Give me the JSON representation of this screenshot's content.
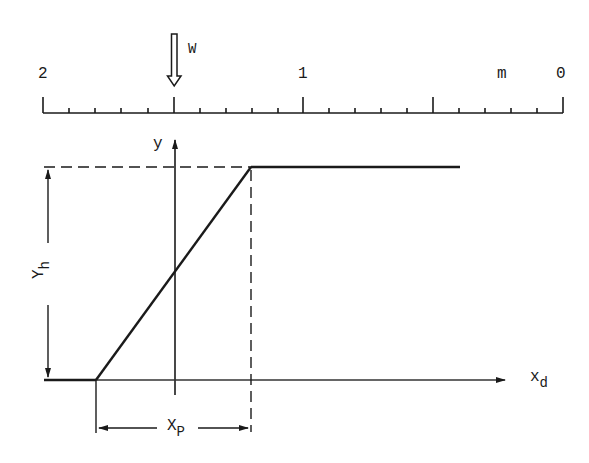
{
  "scale": {
    "labels": [
      {
        "text": "2",
        "x": 38,
        "y": 66
      },
      {
        "text": "1",
        "x": 298,
        "y": 66
      },
      {
        "text": "m",
        "x": 497,
        "y": 66
      },
      {
        "text": "0",
        "x": 556,
        "y": 66
      }
    ],
    "unit": "m",
    "range": [
      2,
      0
    ]
  },
  "marker": {
    "label": "W"
  },
  "axes": {
    "y_label": "y",
    "x_label_main": "x",
    "x_label_sub": "d"
  },
  "dimensions": {
    "yh_main": "Y",
    "yh_sub": "h",
    "xp_main": "X",
    "xp_sub": "P"
  },
  "colors": {
    "ink": "#1a1a1a",
    "background": "#ffffff"
  }
}
